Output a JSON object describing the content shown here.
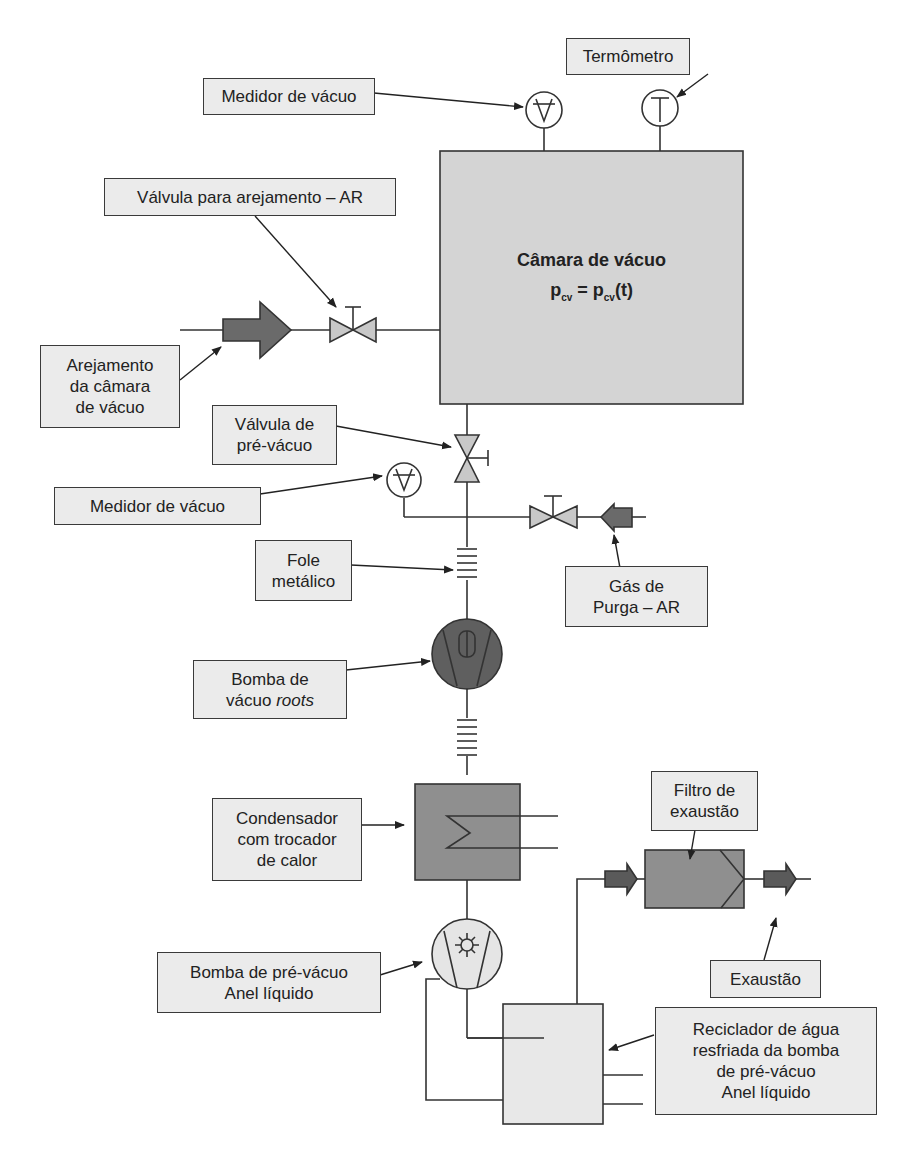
{
  "diagram": {
    "type": "vacuum-system-schematic",
    "colors": {
      "label_fill": "#ebebeb",
      "chamber_fill": "#d4d4d4",
      "dark_component": "#5a5a5a",
      "mid_component": "#8f8f8f",
      "light_component": "#c8c8c8",
      "line": "#333333"
    },
    "chamber": {
      "title": "Câmara de vácuo",
      "formula_p": "p",
      "formula_sub": "cv",
      "formula_eq": " = ",
      "formula_t": "(t)"
    },
    "labels": {
      "medidor_vacuo_top": "Medidor de vácuo",
      "termometro": "Termômetro",
      "valvula_arejamento": "Válvula para arejamento – AR",
      "arejamento_camara": "Arejamento\nda câmara\nde vácuo",
      "valvula_pre_vacuo": "Válvula de\npré-vácuo",
      "medidor_vacuo_mid": "Medidor de vácuo",
      "fole_metalico": "Fole\nmetálico",
      "gas_purga": "Gás de\nPurga – AR",
      "bomba_roots_line1": "Bomba de",
      "bomba_roots_line2a": "vácuo ",
      "bomba_roots_line2b": "roots",
      "condensador": "Condensador\ncom trocador\nde calor",
      "filtro_exaustao": "Filtro de\nexaustão",
      "exaustao": "Exaustão",
      "bomba_pre_vacuo": "Bomba de pré-vácuo\nAnel líquido",
      "reciclador": "Reciclador de água\nresfriada da bomba\nde pré-vácuo\nAnel líquido"
    },
    "components": [
      "vacuum-chamber",
      "vacuum-gauge-top",
      "thermometer",
      "vent-valve",
      "vent-inlet-arrow",
      "pre-vacuum-valve",
      "vacuum-gauge-mid",
      "purge-valve",
      "purge-inlet-arrow",
      "metal-bellows-upper",
      "roots-pump",
      "metal-bellows-lower",
      "condenser",
      "liquid-ring-pump",
      "water-recycler",
      "exhaust-filter",
      "exhaust-arrow-in",
      "exhaust-arrow-out"
    ]
  }
}
